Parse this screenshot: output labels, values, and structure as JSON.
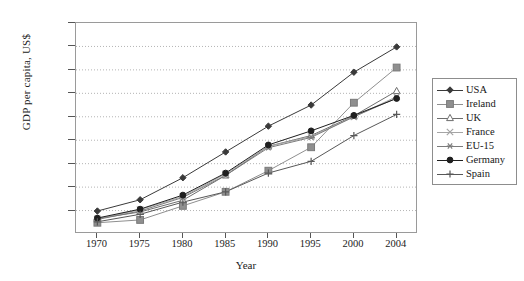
{
  "chart_data": {
    "type": "line",
    "title": "",
    "xlabel": "Year",
    "ylabel": "GDP per capita, US$",
    "categories": [
      "1970",
      "1975",
      "1980",
      "1985",
      "1990",
      "1995",
      "2000",
      "2004"
    ],
    "xticklabels": [
      "1970",
      "1975",
      "1980",
      "1985",
      "1990",
      "1995",
      "2000",
      "2004"
    ],
    "yticklabels": [
      "5000",
      "10000",
      "15000",
      "20000",
      "25000",
      "30000",
      "35000",
      "40000",
      "45000"
    ],
    "ytickvalues": [
      5000,
      10000,
      15000,
      20000,
      25000,
      30000,
      35000,
      40000,
      45000
    ],
    "ylim": [
      0,
      45000
    ],
    "grid": "horizontal-dotted",
    "legend_position": "right-outside",
    "series": [
      {
        "name": "USA",
        "marker": "diamond",
        "color": "#3a3a3a",
        "values": [
          4900,
          7300,
          12000,
          17500,
          23000,
          27500,
          34500,
          39900
        ]
      },
      {
        "name": "Ireland",
        "marker": "square",
        "color": "#8f8f8f",
        "values": [
          2400,
          3000,
          6000,
          9000,
          13500,
          18500,
          28000,
          35500
        ]
      },
      {
        "name": "UK",
        "marker": "triangle",
        "color": "#6e6e6e",
        "values": [
          3300,
          4700,
          7200,
          12500,
          18700,
          21000,
          25200,
          30500
        ]
      },
      {
        "name": "France",
        "marker": "cross-x",
        "color": "#a5a5a5",
        "values": [
          3200,
          5200,
          8000,
          12800,
          18700,
          20800,
          25000,
          29300
        ]
      },
      {
        "name": "EU-15",
        "marker": "star",
        "color": "#7c7c7c",
        "values": [
          3100,
          4900,
          7800,
          12500,
          18400,
          20600,
          25000,
          29000
        ]
      },
      {
        "name": "Germany",
        "marker": "circle",
        "color": "#1f1f1f",
        "values": [
          3400,
          5300,
          8300,
          13000,
          19000,
          22000,
          25300,
          28900
        ]
      },
      {
        "name": "Spain",
        "marker": "plus",
        "color": "#585858",
        "values": [
          2600,
          4200,
          6800,
          9000,
          13000,
          15500,
          21000,
          25500
        ]
      }
    ]
  }
}
